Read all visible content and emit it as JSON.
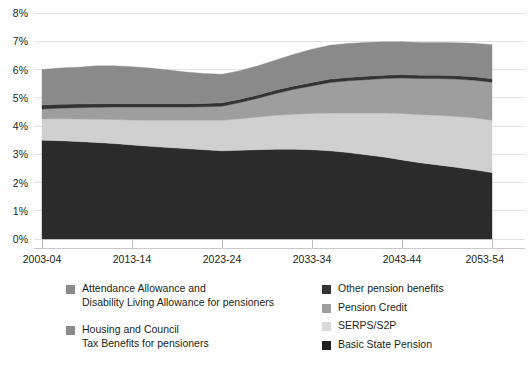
{
  "chart_data": {
    "type": "area",
    "stacked": true,
    "title": "",
    "xlabel": "",
    "ylabel": "",
    "ylim": [
      0,
      8
    ],
    "ytick_labels": [
      "0%",
      "1%",
      "2%",
      "3%",
      "4%",
      "5%",
      "6%",
      "7%",
      "8%"
    ],
    "ytick_values": [
      0,
      1,
      2,
      3,
      4,
      5,
      6,
      7,
      8
    ],
    "grid": true,
    "legend_position": "bottom",
    "xtick_labels": [
      "2003-04",
      "2013-14",
      "2023-24",
      "2033-34",
      "2043-44",
      "2053-54"
    ],
    "xtick_values": [
      2003,
      2013,
      2023,
      2033,
      2043,
      2053
    ],
    "xlim": [
      2003,
      2053
    ],
    "x": [
      2003,
      2005,
      2007,
      2009,
      2011,
      2013,
      2015,
      2017,
      2019,
      2021,
      2023,
      2025,
      2027,
      2029,
      2031,
      2033,
      2035,
      2037,
      2039,
      2041,
      2043,
      2045,
      2047,
      2049,
      2051,
      2053
    ],
    "series": [
      {
        "name": "Basic State Pension",
        "color": "#2b2b2b",
        "values": [
          3.5,
          3.48,
          3.45,
          3.42,
          3.38,
          3.33,
          3.28,
          3.24,
          3.2,
          3.16,
          3.12,
          3.14,
          3.16,
          3.18,
          3.18,
          3.16,
          3.12,
          3.06,
          2.98,
          2.9,
          2.8,
          2.7,
          2.62,
          2.54,
          2.45,
          2.35
        ]
      },
      {
        "name": "SERPS/S2P",
        "color": "#d0d0d0",
        "values": [
          0.75,
          0.78,
          0.8,
          0.82,
          0.85,
          0.88,
          0.92,
          0.96,
          1.0,
          1.04,
          1.08,
          1.12,
          1.16,
          1.2,
          1.24,
          1.28,
          1.34,
          1.4,
          1.48,
          1.56,
          1.64,
          1.7,
          1.76,
          1.8,
          1.84,
          1.85
        ]
      },
      {
        "name": "Pension Credit",
        "color": "#9e9e9e",
        "values": [
          0.35,
          0.37,
          0.4,
          0.42,
          0.44,
          0.46,
          0.47,
          0.47,
          0.47,
          0.48,
          0.5,
          0.57,
          0.66,
          0.77,
          0.88,
          0.98,
          1.08,
          1.14,
          1.18,
          1.22,
          1.26,
          1.28,
          1.3,
          1.32,
          1.33,
          1.35
        ]
      },
      {
        "name": "Other pension benefits",
        "color": "#333333",
        "values": [
          0.14,
          0.14,
          0.13,
          0.13,
          0.12,
          0.12,
          0.12,
          0.12,
          0.12,
          0.12,
          0.12,
          0.12,
          0.12,
          0.12,
          0.12,
          0.12,
          0.12,
          0.12,
          0.12,
          0.12,
          0.12,
          0.12,
          0.12,
          0.12,
          0.12,
          0.12
        ]
      },
      {
        "name": "Housing and Council Tax Benefits for pensioners / Attendance Allowance and Disability Living Allowance for pensioners",
        "color": "#8a8a8a",
        "values": [
          1.26,
          1.28,
          1.3,
          1.34,
          1.34,
          1.31,
          1.26,
          1.19,
          1.12,
          1.06,
          1.01,
          1.01,
          1.03,
          1.07,
          1.12,
          1.18,
          1.2,
          1.2,
          1.2,
          1.18,
          1.16,
          1.16,
          1.16,
          1.17,
          1.19,
          1.21
        ]
      }
    ],
    "totals": [
      6.0,
      6.05,
      6.08,
      6.13,
      6.13,
      6.1,
      6.05,
      5.98,
      5.91,
      5.86,
      5.83,
      5.96,
      6.13,
      6.34,
      6.54,
      6.72,
      6.86,
      6.92,
      6.96,
      6.98,
      6.98,
      6.96,
      6.96,
      6.95,
      6.93,
      6.88
    ]
  },
  "legend": {
    "left_items": [
      {
        "label": "Attendance Allowance and\nDisability Living Allowance for pensioners",
        "color": "#8a8a8a",
        "swatch_name": "attendance-allowance-swatch"
      },
      {
        "label": "Housing and Council\nTax Benefits for pensioners",
        "color": "#8a8a8a",
        "swatch_name": "housing-benefits-swatch"
      }
    ],
    "right_items": [
      {
        "label": "Other pension benefits",
        "color": "#333333",
        "swatch_name": "other-pension-benefits-swatch"
      },
      {
        "label": "Pension Credit",
        "color": "#9e9e9e",
        "swatch_name": "pension-credit-swatch"
      },
      {
        "label": "SERPS/S2P",
        "color": "#d9d9d9",
        "swatch_name": "serps-s2p-swatch"
      },
      {
        "label": "Basic State Pension",
        "color": "#1f1f1f",
        "swatch_name": "basic-state-pension-swatch"
      }
    ]
  }
}
